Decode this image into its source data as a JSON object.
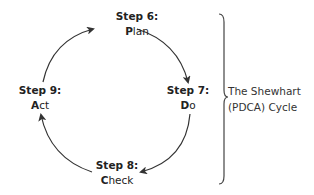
{
  "steps": [
    {
      "head": "Step 6:",
      "initial": "P",
      "rest": "lan"
    },
    {
      "head": "Step 7:",
      "initial": "D",
      "rest": "o"
    },
    {
      "head": "Step 8:",
      "initial": "C",
      "rest": "heck"
    },
    {
      "head": "Step 9:",
      "initial": "A",
      "rest": "ct"
    }
  ],
  "caption": {
    "line1": "The Shewhart",
    "line2": "(PDCA) Cycle"
  }
}
